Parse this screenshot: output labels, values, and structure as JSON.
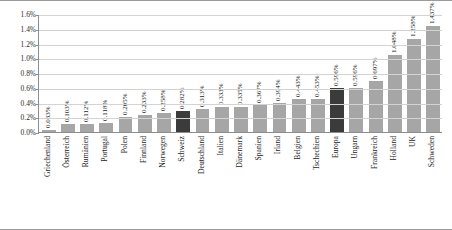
{
  "chart_data": {
    "type": "bar",
    "title": "",
    "subtitle": "",
    "xlabel": "",
    "ylabel": "",
    "ylim": [
      0,
      1.6
    ],
    "yunit": "%",
    "grid": true,
    "legend": false,
    "orientation": "vertical",
    "sorted": "ascending",
    "ytick_labels": [
      "1.6%",
      "1.4%",
      "1.2%",
      "1.0%",
      "0.8%",
      "0.6%",
      "0.4%",
      "0.2%",
      "0.0%"
    ],
    "ytick_values": [
      1.6,
      1.4,
      1.2,
      1.0,
      0.8,
      0.6,
      0.4,
      0.2,
      0.0
    ],
    "categories": [
      "Griechenland",
      "Österreich",
      "Rumänien",
      "Portugal",
      "Polen",
      "Finnland",
      "Norwegen",
      "Schweiz",
      "Deutschland",
      "Italien",
      "Dänemark",
      "Spanien",
      "Irland",
      "Belgien",
      "Tschechien",
      "Europa",
      "Ungarn",
      "Frankreich",
      "Holland",
      "UK",
      "Schweden"
    ],
    "values": [
      0.033,
      0.103,
      0.112,
      0.118,
      0.205,
      0.233,
      0.258,
      0.282,
      0.313,
      0.333,
      0.335,
      0.367,
      0.394,
      0.443,
      0.453,
      0.596,
      0.596,
      0.697,
      1.048,
      1.258,
      1.437
    ],
    "value_labels": [
      "0.033%",
      "0.103%",
      "0.112%",
      "0.118%",
      "0.205%",
      "0.233%",
      "0.258%",
      "0.282%",
      "0.313%",
      "0.333%",
      "0.335%",
      "0.367%",
      "0.394%",
      "0.443%",
      "0.453%",
      "0.596%",
      "0.596%",
      "0.697%",
      "1.048%",
      "1.258%",
      "1.437%"
    ],
    "highlighted": [
      "Schweiz",
      "Europa"
    ],
    "colors": {
      "bar": "#a6a6a6",
      "bar_highlight": "#3b3b3b",
      "grid": "#d3d3d3",
      "axis": "#8d8d8d",
      "text": "#1c1c1c"
    }
  }
}
